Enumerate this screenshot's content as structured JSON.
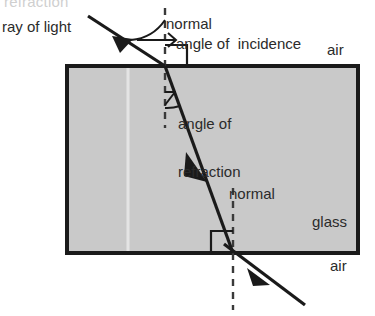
{
  "diagram": {
    "title": "refraction",
    "scanned_artifact_text": "refraction",
    "labels": {
      "ray_of_light": "ray of light",
      "normal_top": "normal",
      "normal_bottom": "normal",
      "angle_of_incidence": "angle of  incidence",
      "angle_of_refraction_line1": "angle of",
      "angle_of_refraction_line2": "refraction",
      "air_top": "air",
      "air_bottom": "air",
      "glass": "glass"
    },
    "colors": {
      "ink": "#2b2b2b",
      "glass_fill": "#c9c9c9",
      "block_border": "#1a1a1a",
      "background": "#ffffff",
      "faint_artifact": "#cfcfcf"
    },
    "geometry": {
      "block": {
        "x": 67,
        "y": 66,
        "width": 291,
        "height": 187
      },
      "normal_top_x": 165,
      "normal_bottom_x": 233,
      "entry_point": {
        "x": 165,
        "y": 66
      },
      "exit_point": {
        "x": 233,
        "y": 253
      },
      "incoming_ray_start": {
        "x": 88,
        "y": 16
      },
      "exit_ray_end": {
        "x": 305,
        "y": 305
      },
      "right_angle_marker": {
        "x": 233,
        "y": 253,
        "size": 22
      }
    }
  }
}
